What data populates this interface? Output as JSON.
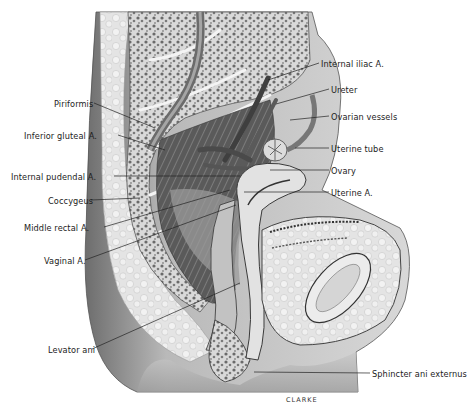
{
  "figure": {
    "type": "anatomical-illustration",
    "view": "sagittal section of female pelvis",
    "signature": "CLARKE"
  },
  "labels_left": [
    {
      "text": "Piriformis",
      "x": 54,
      "y": 99,
      "target": [
        155,
        128
      ]
    },
    {
      "text": "Inferior gluteal A.",
      "x": 24,
      "y": 131,
      "target": [
        165,
        150
      ]
    },
    {
      "text": "Internal pudendal A.",
      "x": 11,
      "y": 172,
      "target": [
        240,
        176
      ]
    },
    {
      "text": "Coccygeus",
      "x": 48,
      "y": 196,
      "target": [
        140,
        198
      ]
    },
    {
      "text": "Middle rectal A.",
      "x": 24,
      "y": 223,
      "target": [
        230,
        190
      ]
    },
    {
      "text": "Vaginal A.",
      "x": 44,
      "y": 256,
      "target": [
        236,
        205
      ]
    },
    {
      "text": "Levator ani",
      "x": 48,
      "y": 345,
      "target": [
        240,
        283
      ]
    }
  ],
  "labels_right": [
    {
      "text": "Internal iliac A.",
      "x": 321,
      "y": 59,
      "target": [
        268,
        80
      ]
    },
    {
      "text": "Ureter",
      "x": 331,
      "y": 85,
      "target": [
        276,
        104
      ]
    },
    {
      "text": "Ovarian vessels",
      "x": 331,
      "y": 112,
      "target": [
        290,
        120
      ]
    },
    {
      "text": "Uterine tube",
      "x": 331,
      "y": 144,
      "target": [
        295,
        148
      ]
    },
    {
      "text": "Ovary",
      "x": 331,
      "y": 166,
      "target": [
        270,
        170
      ]
    },
    {
      "text": "Uterine A.",
      "x": 331,
      "y": 188,
      "target": [
        244,
        192
      ]
    },
    {
      "text": "Sphincter ani externus",
      "x": 372,
      "y": 369,
      "target": [
        254,
        372
      ]
    }
  ],
  "colors": {
    "background": "#ffffff",
    "bone_light": "#e6e6e6",
    "bone_spongy": "#8c8c8c",
    "muscle_dark": "#4a4a4a",
    "soft_tissue": "#bdbdbd",
    "skin_shadow": "#9a9a9a",
    "label_text": "#1c1c1c",
    "leader_line": "#222222"
  }
}
